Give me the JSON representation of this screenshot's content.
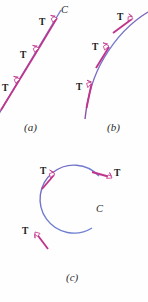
{
  "figure": {
    "background_color": "#fefefe",
    "curve_color_start": "#6f7fd0",
    "curve_color_end": "#8a4fa8",
    "vector_color": "#c0348c",
    "arrowhead_fill": "#ffffff",
    "label_color": "#1a1a1a"
  },
  "panels": [
    {
      "id": "a",
      "caption": "(a)",
      "curve_label": "C",
      "description": "straight line with three tangent vectors",
      "vectors": [
        {
          "label": "T",
          "point": [
            14,
            89
          ]
        },
        {
          "label": "T",
          "point": [
            33,
            60
          ]
        },
        {
          "label": "T",
          "point": [
            51,
            27
          ]
        }
      ]
    },
    {
      "id": "b",
      "caption": "(b)",
      "curve_label": "",
      "description": "curved arc with three tangent vectors",
      "vectors": [
        {
          "label": "T",
          "point": [
            91,
            89
          ]
        },
        {
          "label": "T",
          "point": [
            106,
            50
          ]
        },
        {
          "label": "T",
          "point": [
            130,
            21
          ]
        }
      ]
    },
    {
      "id": "c",
      "caption": "(c)",
      "curve_label": "C",
      "description": "nearly closed circular curve with three tangent vectors",
      "vectors": [
        {
          "label": "T",
          "point": [
            52,
            177
          ]
        },
        {
          "label": "T",
          "point": [
            111,
            176
          ]
        },
        {
          "label": "T",
          "point": [
            36,
            234
          ]
        }
      ]
    }
  ],
  "labels": {
    "t_vector": "T",
    "curve_c": "C",
    "caption_a": "(a)",
    "caption_b": "(b)",
    "caption_c": "(c)"
  }
}
